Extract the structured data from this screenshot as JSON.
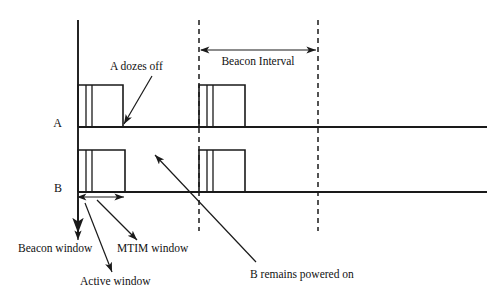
{
  "figure": {
    "kind": "timing-diagram",
    "topic": "IEEE 802.11 power save beacon timing",
    "background_color": "#ffffff",
    "line_color": "#1a1a1a",
    "text_color": "#111111"
  },
  "axes": {
    "vertical_axis_name": "vertical-time-axis",
    "stations": [
      {
        "id": "A",
        "label": "A",
        "label_x": 62,
        "label_y": 127,
        "baseline_y": 127,
        "baseline_x_start": 78,
        "baseline_x_end": 487
      },
      {
        "id": "B",
        "label": "B",
        "label_x": 62,
        "label_y": 192,
        "baseline_y": 192,
        "baseline_x_start": 78,
        "baseline_x_end": 487
      }
    ],
    "time_axis": {
      "x": 78,
      "y_top": 20,
      "y_bottom": 233
    }
  },
  "dashed_markers": [
    {
      "name": "beacon-boundary-left",
      "x": 199,
      "y_top": 20,
      "y_bottom": 231
    },
    {
      "name": "beacon-boundary-right",
      "x": 318,
      "y_top": 20,
      "y_bottom": 231
    }
  ],
  "pulses": {
    "station_a": [
      {
        "name": "a-pulse-first",
        "x_start": 78,
        "x_end": 123,
        "y_top": 85,
        "y_base": 127,
        "dividers": [
          86,
          92
        ]
      },
      {
        "name": "a-pulse-second",
        "x_start": 199,
        "x_end": 245,
        "y_top": 85,
        "y_base": 127,
        "dividers": [
          207,
          213
        ]
      }
    ],
    "station_b": [
      {
        "name": "b-pulse-first",
        "x_start": 78,
        "x_end": 125,
        "y_top": 150,
        "y_base": 192,
        "dividers": [
          86,
          92
        ]
      },
      {
        "name": "b-pulse-second",
        "x_start": 199,
        "x_end": 245,
        "y_top": 150,
        "y_base": 192,
        "dividers": [
          207,
          213
        ]
      }
    ]
  },
  "measures": [
    {
      "name": "beacon-interval-measure",
      "label": "Beacon Interval",
      "x_start": 201,
      "x_end": 316,
      "y": 50,
      "label_x": 258,
      "label_y": 65,
      "label_anchor": "middle"
    },
    {
      "name": "active-window-measure",
      "label": "",
      "x_start": 78,
      "x_end": 124,
      "y": 197,
      "label_x": 0,
      "label_y": 0,
      "label_anchor": "middle"
    }
  ],
  "annotations": [
    {
      "name": "a-dozes-off-annotation",
      "label": "A dozes off",
      "text_x": 110,
      "text_y": 70,
      "text_anchor": "start",
      "arrow_from_x": 152,
      "arrow_from_y": 76,
      "arrow_to_x": 124,
      "arrow_to_y": 124
    },
    {
      "name": "b-remains-powered-on-annotation",
      "label": "B remains powered on",
      "text_x": 250,
      "text_y": 278,
      "text_anchor": "start",
      "arrow_from_x": 256,
      "arrow_from_y": 262,
      "arrow_to_x": 155,
      "arrow_to_y": 155
    },
    {
      "name": "beacon-window-annotation",
      "label": "Beacon window",
      "text_x": 18,
      "text_y": 252,
      "text_anchor": "start",
      "arrow_from_x": 78,
      "arrow_from_y": 200,
      "arrow_to_x": 78,
      "arrow_to_y": 240
    },
    {
      "name": "mtim-window-annotation",
      "label": "MTIM window",
      "text_x": 117,
      "text_y": 252,
      "text_anchor": "start",
      "arrow_from_x": 97,
      "arrow_from_y": 200,
      "arrow_to_x": 137,
      "arrow_to_y": 240
    },
    {
      "name": "active-window-annotation",
      "label": "Active window",
      "text_x": 80,
      "text_y": 285,
      "text_anchor": "start",
      "arrow_from_x": 85,
      "arrow_from_y": 203,
      "arrow_to_x": 112,
      "arrow_to_y": 272
    }
  ]
}
